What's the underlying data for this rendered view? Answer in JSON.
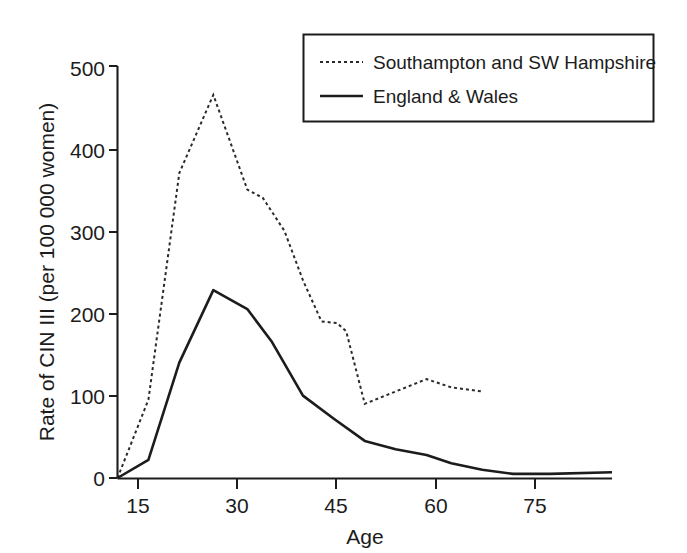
{
  "chart_data": {
    "type": "line",
    "title": "",
    "xlabel": "Age",
    "ylabel": "Rate of CIN III (per 100 000 women)",
    "xlim": [
      12,
      92
    ],
    "ylim": [
      0,
      500
    ],
    "xticks": [
      15,
      30,
      45,
      60,
      75
    ],
    "yticks": [
      0,
      100,
      200,
      300,
      400,
      500
    ],
    "xtick_labels": [
      "15",
      "30",
      "45",
      "60",
      "75"
    ],
    "ytick_labels": [
      "0",
      "100",
      "200",
      "300",
      "400",
      "500"
    ],
    "grid": false,
    "legend_position": "top-right",
    "series": [
      {
        "name": "Southampton and SW Hampshire",
        "style": "dotted",
        "color": "#2a2a2a",
        "x": [
          12,
          17,
          22,
          27.5,
          33,
          35.5,
          39,
          42,
          45,
          47.5,
          49,
          52,
          57,
          62,
          66,
          71
        ],
        "y": [
          0,
          95,
          370,
          465,
          350,
          340,
          300,
          240,
          190,
          188,
          178,
          90,
          105,
          120,
          110,
          105
        ]
      },
      {
        "name": "England & Wales",
        "style": "solid",
        "color": "#1c1c1c",
        "x": [
          12,
          17,
          22,
          27.5,
          33,
          37,
          42,
          47,
          52,
          57,
          62,
          66,
          71,
          76,
          82,
          92
        ],
        "y": [
          0,
          22,
          140,
          228,
          205,
          165,
          100,
          72,
          45,
          35,
          28,
          18,
          10,
          5,
          5,
          7
        ]
      }
    ]
  },
  "legend": {
    "entries": [
      {
        "label": "Southampton and SW Hampshire",
        "style": "dotted"
      },
      {
        "label": "England & Wales",
        "style": "solid"
      }
    ]
  },
  "axes": {
    "x_title": "Age",
    "y_title": "Rate of CIN III (per 100 000 women)"
  }
}
